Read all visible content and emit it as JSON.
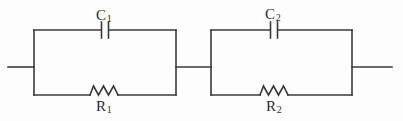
{
  "diagram": {
    "background_color": "#fdfdfd",
    "line_color": "#3a3a3a",
    "line_width": 1.6,
    "text_color": "#2b2b2b"
  },
  "labels": {
    "c1": {
      "symbol": "C",
      "subscript": "1",
      "full": "C1"
    },
    "c2": {
      "symbol": "C",
      "subscript": "2",
      "full": "C2"
    },
    "r1": {
      "symbol": "R",
      "subscript": "1",
      "full": "R1"
    },
    "r2": {
      "symbol": "R",
      "subscript": "2",
      "full": "R2"
    }
  },
  "components": [
    {
      "name": "capacitor-c1",
      "type": "capacitor",
      "label": "C1",
      "branch": "top",
      "block": 1
    },
    {
      "name": "resistor-r1",
      "type": "resistor",
      "label": "R1",
      "branch": "bottom",
      "block": 1
    },
    {
      "name": "capacitor-c2",
      "type": "capacitor",
      "label": "C2",
      "branch": "top",
      "block": 2
    },
    {
      "name": "resistor-r2",
      "type": "resistor",
      "label": "R2",
      "branch": "bottom",
      "block": 2
    }
  ],
  "nodes": {
    "left_terminal": "open lead, left edge",
    "middle_junction": "series link between block 1 and block 2",
    "right_terminal": "open lead, right edge"
  },
  "geometry": {
    "block1": {
      "left": 34,
      "right": 176,
      "top": 30,
      "bottom": 95
    },
    "block2": {
      "left": 211,
      "right": 352,
      "top": 30,
      "bottom": 95
    },
    "mid_y": 67,
    "left_lead_start": 8,
    "right_lead_end": 392,
    "cap1_x": 105,
    "cap2_x": 274,
    "res1_x": [
      90,
      118
    ],
    "res2_x": [
      260,
      288
    ]
  }
}
